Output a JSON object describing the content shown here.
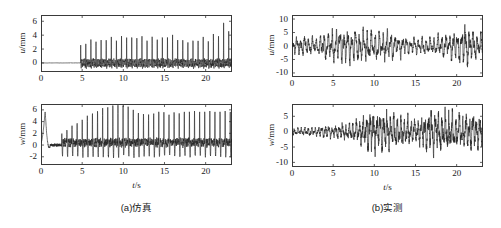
{
  "figure": {
    "background": "#ffffff",
    "line_color": "#262626",
    "axis_color": "#3a3a3a"
  },
  "panels": [
    {
      "id": "sim-u",
      "caption_group": "a",
      "ylabel_var": "u",
      "ylabel_unit": "/mm",
      "xlabel_var": "t",
      "xlabel_unit": "/s",
      "yticks": [
        "0",
        "2",
        "4",
        "6"
      ],
      "ytick_values": [
        0,
        2,
        4,
        6
      ],
      "xticks": [
        "0",
        "5",
        "10",
        "15",
        "20"
      ],
      "xtick_values": [
        0,
        5,
        10,
        15,
        20
      ],
      "xlim": [
        0,
        23.2
      ],
      "ylim": [
        -1.3,
        6.9
      ],
      "show_xlabel": false
    },
    {
      "id": "sim-w",
      "caption_group": "a",
      "ylabel_var": "w",
      "ylabel_unit": "/mm",
      "xlabel_var": "t",
      "xlabel_unit": "/s",
      "yticks": [
        "-2",
        "0",
        "2",
        "4",
        "6"
      ],
      "ytick_values": [
        -2,
        0,
        2,
        4,
        6
      ],
      "xticks": [
        "0",
        "5",
        "10",
        "15",
        "20"
      ],
      "xtick_values": [
        0,
        5,
        10,
        15,
        20
      ],
      "xlim": [
        0,
        23.2
      ],
      "ylim": [
        -3.4,
        7.0
      ],
      "show_xlabel": true
    },
    {
      "id": "meas-u",
      "caption_group": "b",
      "ylabel_var": "u",
      "ylabel_unit": "/mm",
      "xlabel_var": "t",
      "xlabel_unit": "/s",
      "yticks": [
        "-10",
        "-5",
        "0",
        "5",
        "10"
      ],
      "ytick_values": [
        -10,
        -5,
        0,
        5,
        10
      ],
      "xticks": [
        "0",
        "5",
        "10",
        "15",
        "20"
      ],
      "xtick_values": [
        0,
        5,
        10,
        15,
        20
      ],
      "xlim": [
        0,
        23.2
      ],
      "ylim": [
        -11.5,
        11.5
      ],
      "show_xlabel": false
    },
    {
      "id": "meas-w",
      "caption_group": "b",
      "ylabel_var": "w",
      "ylabel_unit": "/mm",
      "xlabel_var": "t",
      "xlabel_unit": "/s",
      "yticks": [
        "-10",
        "-5",
        "0",
        "5"
      ],
      "ytick_values": [
        -10,
        -5,
        0,
        5
      ],
      "xticks": [
        "0",
        "5",
        "10",
        "15",
        "20"
      ],
      "xtick_values": [
        0,
        5,
        10,
        15,
        20
      ],
      "xlim": [
        0,
        23.2
      ],
      "ylim": [
        -11.5,
        9.0
      ],
      "show_xlabel": true
    }
  ],
  "captions": [
    {
      "id": "caption-a",
      "text": "(a)仿真"
    },
    {
      "id": "caption-b",
      "text": "(b)实测"
    }
  ],
  "chart_data": [
    {
      "id": "sim-u",
      "type": "line",
      "title": "",
      "xlabel": "t/s",
      "ylabel": "u/mm",
      "xlim": [
        0,
        23.2
      ],
      "ylim": [
        -1.3,
        6.9
      ],
      "grid": false,
      "legend": null,
      "description": "Simulated longitudinal displacement: zero until t=4.8 s, then periodic sharp positive spikes with small negative undershoots; spike amplitude ~3-4 mm rising to ~6.3 mm near t=21.5 s.",
      "series": [
        {
          "name": "u simulated",
          "model": "spike_train",
          "onset": 4.8,
          "base_period": 0.62,
          "spike_peaks": [
            2.6,
            3.0,
            3.4,
            3.1,
            3.6,
            3.3,
            3.8,
            3.5,
            3.9,
            3.7,
            4.0,
            3.6,
            3.9,
            3.5,
            3.8,
            3.4,
            4.0,
            3.7,
            4.1,
            3.6,
            3.3,
            3.0,
            3.5,
            3.2,
            3.8,
            3.4,
            4.2,
            3.9,
            6.3,
            4.6,
            5.2,
            4.8
          ],
          "undershoot": -0.85,
          "baseline": 0.0
        }
      ]
    },
    {
      "id": "sim-w",
      "type": "line",
      "title": "",
      "xlabel": "t/s",
      "ylabel": "w/mm",
      "xlim": [
        0,
        23.2
      ],
      "ylim": [
        -3.4,
        7.0
      ],
      "grid": false,
      "legend": null,
      "description": "Simulated vertical displacement: initial transient peak ~5.3 mm at t=0.5 s decaying to ~0.3 mm by t=2; oscillation amplitude then grows, peaks ~6.5 mm around t=11-14 s, remains 4-6 mm through t=23.",
      "series": [
        {
          "name": "w simulated",
          "model": "growing_spike_train",
          "transient_peak": 5.3,
          "transient_time": 0.5,
          "onset": 2.5,
          "base_period": 0.62,
          "envelope_peaks": [
            1.6,
            2.2,
            2.9,
            3.4,
            4.0,
            4.6,
            5.1,
            5.5,
            5.9,
            6.2,
            6.5,
            6.4,
            6.5,
            6.3,
            5.6,
            5.2,
            5.0,
            4.8,
            5.1,
            5.4,
            5.2,
            4.9,
            5.3,
            5.0,
            5.4
          ],
          "undershoot": -2.6,
          "baseline": 0.4
        }
      ]
    },
    {
      "id": "meas-u",
      "type": "line",
      "title": "",
      "xlabel": "t/s",
      "ylabel": "u/mm",
      "xlim": [
        0,
        23.2
      ],
      "ylim": [
        -11.5,
        11.5
      ],
      "grid": false,
      "legend": null,
      "description": "Measured longitudinal displacement: dense noisy oscillation about 0, amplitude ~4 mm at t<3, ~6-8 mm for 3<t<13, reduced ~3-4 mm around 14-18 s, rising again to ~9 mm near t=21.",
      "series": [
        {
          "name": "u measured",
          "model": "noisy_oscillation",
          "envelope_x": [
            0,
            1,
            2,
            3,
            4,
            5,
            6,
            7,
            8,
            9,
            10,
            11,
            12,
            13,
            14,
            15,
            16,
            17,
            18,
            19,
            20,
            21,
            22,
            23.2
          ],
          "envelope_y": [
            2.6,
            4.3,
            4.0,
            3.0,
            5.5,
            6.2,
            6.4,
            6.8,
            6.2,
            6.5,
            6.0,
            5.8,
            5.4,
            4.6,
            3.6,
            3.2,
            3.4,
            3.3,
            4.4,
            5.2,
            5.6,
            8.6,
            6.0,
            5.4
          ],
          "base_frequency": 2.1,
          "noise_level": 0.45,
          "baseline": 0.0
        }
      ]
    },
    {
      "id": "meas-w",
      "type": "line",
      "title": "",
      "xlabel": "t/s",
      "ylabel": "w/mm",
      "xlim": [
        0,
        23.2
      ],
      "ylim": [
        -11.5,
        9.0
      ],
      "grid": false,
      "legend": null,
      "description": "Measured vertical displacement: low-amplitude noise ~1.5 mm for t<5, growing irregular oscillation reaching ~8 mm peaks and -9 mm troughs between t=9 and t=23.",
      "series": [
        {
          "name": "w measured",
          "model": "noisy_oscillation",
          "envelope_x": [
            0,
            1,
            2,
            3,
            4,
            5,
            6,
            7,
            8,
            9,
            10,
            11,
            12,
            13,
            14,
            15,
            16,
            17,
            18,
            19,
            20,
            21,
            22,
            23.2
          ],
          "envelope_y": [
            1.5,
            1.4,
            1.6,
            1.5,
            2.4,
            2.0,
            2.8,
            3.2,
            4.0,
            6.2,
            6.8,
            7.2,
            6.0,
            5.2,
            4.8,
            4.4,
            5.6,
            7.4,
            6.6,
            7.0,
            5.8,
            6.4,
            6.0,
            5.2
          ],
          "base_frequency": 2.4,
          "noise_level": 0.55,
          "baseline": 0.0
        }
      ]
    }
  ]
}
